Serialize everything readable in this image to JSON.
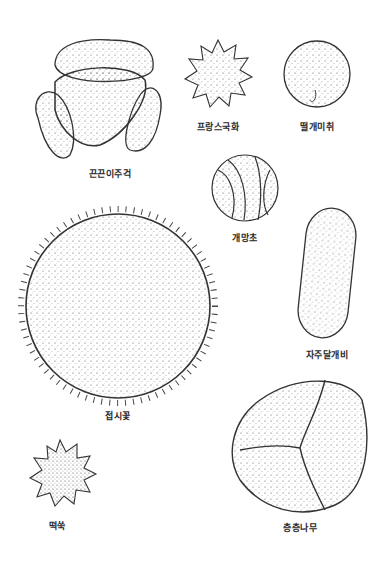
{
  "figure": {
    "type": "pollen grain illustration plate",
    "background": "#ffffff",
    "ink_color": "#2a2a2a",
    "specimens": [
      {
        "id": "sundew",
        "label": "끈끈이주걱",
        "shape": "tetrad",
        "label_pos": [
          110,
          172
        ]
      },
      {
        "id": "french-marigold",
        "label": "프랑스국화",
        "shape": "spiky-star",
        "label_pos": [
          218,
          125
        ]
      },
      {
        "id": "ragweed",
        "label": "떨개미취",
        "shape": "sphere-pores",
        "label_pos": [
          317,
          125
        ]
      },
      {
        "id": "wolfsbane",
        "label": "개망초",
        "shape": "sphere-furrowed",
        "label_pos": [
          245,
          236
        ]
      },
      {
        "id": "purple-dayflower",
        "label": "자주달개비",
        "shape": "ellipsoid",
        "label_pos": [
          327,
          353
        ]
      },
      {
        "id": "balsam",
        "label": "접시꽃",
        "shape": "large-echinate-sphere",
        "label_pos": [
          118,
          414
        ]
      },
      {
        "id": "cudweed",
        "label": "떡쑥",
        "shape": "spiky-star-small",
        "label_pos": [
          57,
          524
        ]
      },
      {
        "id": "dogwood",
        "label": "층층나무",
        "shape": "tricolporate",
        "label_pos": [
          300,
          526
        ]
      }
    ]
  }
}
